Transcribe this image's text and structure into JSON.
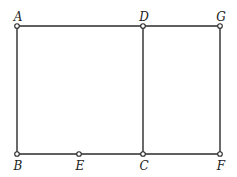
{
  "diagram": {
    "points": [
      {
        "id": "A",
        "x": 17,
        "y": 26,
        "lx": 18,
        "ly": 17
      },
      {
        "id": "D",
        "x": 143,
        "y": 26,
        "lx": 144,
        "ly": 17
      },
      {
        "id": "G",
        "x": 220,
        "y": 26,
        "lx": 221,
        "ly": 17
      },
      {
        "id": "B",
        "x": 17,
        "y": 154,
        "lx": 18,
        "ly": 170
      },
      {
        "id": "E",
        "x": 79,
        "y": 154,
        "lx": 80,
        "ly": 170
      },
      {
        "id": "C",
        "x": 143,
        "y": 154,
        "lx": 144,
        "ly": 170
      },
      {
        "id": "F",
        "x": 220,
        "y": 154,
        "lx": 221,
        "ly": 170
      }
    ],
    "segments": [
      [
        "A",
        "D"
      ],
      [
        "D",
        "G"
      ],
      [
        "A",
        "B"
      ],
      [
        "D",
        "C"
      ],
      [
        "G",
        "F"
      ],
      [
        "B",
        "E"
      ],
      [
        "E",
        "C"
      ],
      [
        "C",
        "F"
      ]
    ],
    "labels": {
      "A": "A",
      "B": "B",
      "C": "C",
      "D": "D",
      "E": "E",
      "F": "F",
      "G": "G"
    }
  }
}
